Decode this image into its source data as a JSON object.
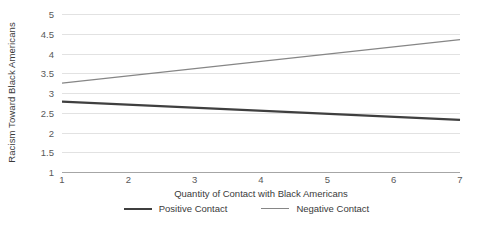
{
  "chart_data": {
    "type": "line",
    "title": "",
    "xlabel": "Quantity of Contact with Black Americans",
    "ylabel": "Racism Toward Black Americans",
    "x": [
      1,
      7
    ],
    "xlim": [
      1,
      7
    ],
    "ylim": [
      1,
      5
    ],
    "x_ticks": [
      "1",
      "2",
      "3",
      "4",
      "5",
      "6",
      "7"
    ],
    "y_ticks": [
      "1",
      "1.5",
      "2",
      "2.5",
      "3",
      "3.5",
      "4",
      "4.5",
      "5"
    ],
    "grid": true,
    "legend_position": "bottom",
    "series": [
      {
        "name": "Positive Contact",
        "values": [
          2.78,
          2.32
        ],
        "color": "#3f3f3f",
        "width": 2.2
      },
      {
        "name": "Negative Contact",
        "values": [
          3.25,
          4.35
        ],
        "color": "#868686",
        "width": 1.4
      }
    ]
  },
  "axis": {
    "y_title": "Racism Toward Black Americans",
    "x_title": "Quantity of Contact with Black Americans",
    "y_ticks": [
      "5",
      "4.5",
      "4",
      "3.5",
      "3",
      "2.5",
      "2",
      "1.5",
      "1"
    ],
    "x_ticks": [
      "1",
      "2",
      "3",
      "4",
      "5",
      "6",
      "7"
    ],
    "gridline_color": "#e2e2e2",
    "baseline_color": "#a6a6a6",
    "tick_text_color": "#595959"
  },
  "legend": {
    "items": [
      {
        "label": "Positive Contact",
        "color": "#3f3f3f",
        "thickness": "2.2px"
      },
      {
        "label": "Negative Contact",
        "color": "#868686",
        "thickness": "1.4px"
      }
    ]
  }
}
